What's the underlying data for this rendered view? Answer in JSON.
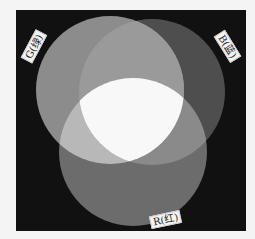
{
  "diagram": {
    "type": "additive-color-venn",
    "background": "#111111",
    "circles": [
      {
        "id": "G",
        "label": "G(绿)",
        "cx": 110,
        "cy": 90,
        "r": 74,
        "gray": "#8c8c8c"
      },
      {
        "id": "B",
        "label": "B(蓝)",
        "cx": 152,
        "cy": 92,
        "r": 73,
        "gray": "#4e4e4e"
      },
      {
        "id": "R",
        "label": "R(红)",
        "cx": 133,
        "cy": 152,
        "r": 74,
        "gray": "#6c6c6c"
      }
    ],
    "overlaps": {
      "G_B": "#9a9a9a",
      "G_R": "#b8b8b8",
      "B_R": "#8a8a8a",
      "center": "#f8f8f8"
    }
  },
  "labels": {
    "g": "G(绿)",
    "b": "B(蓝)",
    "r": "R(红)"
  }
}
